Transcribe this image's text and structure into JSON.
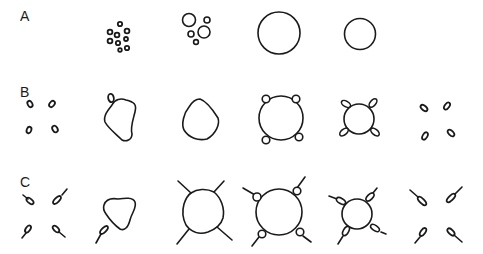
{
  "rows": [
    {
      "label": "A",
      "description": "Row A: cluster of small vesicles, fewer larger vesicles, one large sphere, one smaller sphere"
    },
    {
      "label": "B",
      "description": "Row B: four small oval bodies, irregular body with one oval, irregular body, sphere with four small round bodies, sphere with four elongated bodies, four elongated bodies dispersed"
    },
    {
      "label": "C",
      "description": "Row C: four tailed bodies, irregular body with one tailed body, sphere with four rod projections, sphere with four tailed round bodies, sphere with four tailed elongated bodies, four tailed bodies dispersed"
    }
  ],
  "colors": {
    "stroke": "#1a1a1a",
    "background": "#ffffff"
  }
}
